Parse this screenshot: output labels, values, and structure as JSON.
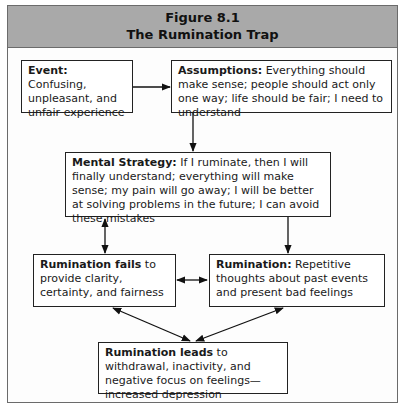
{
  "figure": {
    "number": "Figure 8.1",
    "title": "The Rumination Trap"
  },
  "boxes": {
    "event": {
      "label": "Event:",
      "text": " Confusing, unpleasant, and unfair experience"
    },
    "assumptions": {
      "label": "Assumptions:",
      "text": " Everything should make sense; people should act only one way; life should be fair; I need to understand"
    },
    "mental_strategy": {
      "label": "Mental Strategy:",
      "text": " If I ruminate, then I will finally understand; everything will make sense; my pain will go away; I will be better at solving problems in the future; I can avoid these mistakes"
    },
    "rumination_fails": {
      "label": "Rumination fails",
      "text": " to provide clarity, certainty, and fairness"
    },
    "rumination": {
      "label": "Rumination:",
      "text": " Repetitive thoughts about past events and present bad feelings"
    },
    "rumination_leads": {
      "label": "Rumination leads",
      "text": " to withdrawal, inactivity, and negative focus on feelings—increased depression"
    }
  },
  "connections": [
    {
      "from": "event",
      "to": "assumptions",
      "type": "one-way"
    },
    {
      "from": "assumptions",
      "to": "mental_strategy",
      "type": "one-way"
    },
    {
      "from": "mental_strategy",
      "to": "rumination_fails",
      "type": "two-way"
    },
    {
      "from": "mental_strategy",
      "to": "rumination",
      "type": "one-way"
    },
    {
      "from": "rumination_fails",
      "to": "rumination",
      "type": "two-way"
    },
    {
      "from": "rumination_fails",
      "to": "rumination_leads",
      "type": "two-way"
    },
    {
      "from": "rumination",
      "to": "rumination_leads",
      "type": "two-way"
    }
  ],
  "colors": {
    "header_bg": "#a9a9a9",
    "border": "#222222"
  }
}
